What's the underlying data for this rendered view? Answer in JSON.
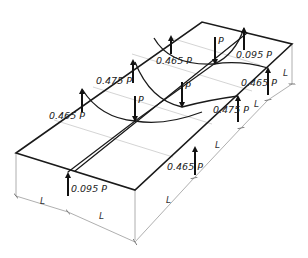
{
  "diagram": {
    "loads": [
      {
        "id": "p1",
        "label": "P",
        "direction": "down"
      },
      {
        "id": "p2",
        "label": "P",
        "direction": "down"
      },
      {
        "id": "p3",
        "label": "P",
        "direction": "down"
      }
    ],
    "reactions": [
      {
        "id": "r_front_left",
        "label": "0.095 P",
        "direction": "up"
      },
      {
        "id": "r_left_mid",
        "label": "0.465 P",
        "direction": "up"
      },
      {
        "id": "r_back_mid1",
        "label": "0.475 P",
        "direction": "up"
      },
      {
        "id": "r_back_mid2",
        "label": "0.465 P",
        "direction": "up"
      },
      {
        "id": "r_back_right",
        "label": "0.095 P",
        "direction": "up"
      },
      {
        "id": "r_right_mid1",
        "label": "0.465 P",
        "direction": "up"
      },
      {
        "id": "r_right_mid2",
        "label": "0.475 P",
        "direction": "up"
      },
      {
        "id": "r_front_mid",
        "label": "0.465 P",
        "direction": "up"
      }
    ],
    "dimensions": [
      {
        "id": "d1",
        "label": "L"
      },
      {
        "id": "d2",
        "label": "L"
      },
      {
        "id": "d3",
        "label": "L"
      },
      {
        "id": "d4",
        "label": "L"
      },
      {
        "id": "d5",
        "label": "L"
      }
    ],
    "colors": {
      "edge": "#1a1a1a",
      "grid": "#cfcfcf",
      "dimension": "#9a9a9a"
    }
  }
}
